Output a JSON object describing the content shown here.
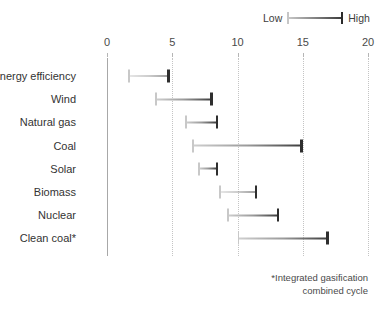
{
  "legend": {
    "low_label": "Low",
    "high_label": "High",
    "low_color": "#c8c8c8",
    "high_color": "#2e2e2e"
  },
  "footnote": {
    "line1": "*Integrated gasification",
    "line2": "combined cycle"
  },
  "chart_data": {
    "type": "bar",
    "orientation": "horizontal",
    "subtype": "range-bar",
    "title": "",
    "subtitle": "",
    "xlabel": "",
    "ylabel": "",
    "xlim": [
      0,
      20
    ],
    "xticks": [
      0,
      5,
      10,
      15,
      20
    ],
    "xtick_labels": [
      "0",
      "5",
      "10",
      "15",
      "20"
    ],
    "grid": true,
    "grid_axis": "x",
    "grid_style": "dotted",
    "legend_position": "top-right",
    "legend_entries": [
      "Low",
      "High"
    ],
    "categories": [
      "Energy efficiency",
      "Wind",
      "Natural gas",
      "Coal",
      "Solar",
      "Biomass",
      "Nuclear",
      "Clean coal*"
    ],
    "series": [
      {
        "name": "Low",
        "values": [
          1.6,
          3.7,
          6.0,
          6.5,
          7.0,
          8.6,
          9.2,
          10.0
        ]
      },
      {
        "name": "High",
        "values": [
          4.8,
          8.1,
          8.5,
          15.0,
          8.5,
          11.5,
          13.2,
          17.0
        ]
      }
    ],
    "ranges": [
      {
        "category": "Energy efficiency",
        "low": 1.6,
        "high": 4.8
      },
      {
        "category": "Wind",
        "low": 3.7,
        "high": 8.1
      },
      {
        "category": "Natural gas",
        "low": 6.0,
        "high": 8.5
      },
      {
        "category": "Coal",
        "low": 6.5,
        "high": 15.0
      },
      {
        "category": "Solar",
        "low": 7.0,
        "high": 8.5
      },
      {
        "category": "Biomass",
        "low": 8.6,
        "high": 11.5
      },
      {
        "category": "Nuclear",
        "low": 9.2,
        "high": 13.2
      },
      {
        "category": "Clean coal*",
        "low": 10.0,
        "high": 17.0
      }
    ],
    "annotations": [
      "*Integrated gasification combined cycle"
    ]
  }
}
